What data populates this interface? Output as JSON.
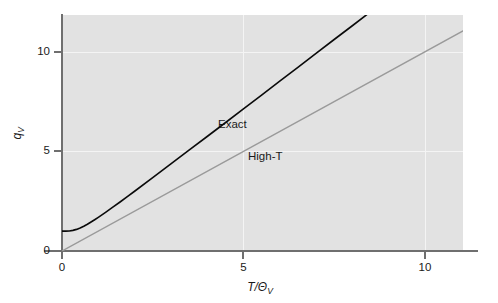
{
  "chart_data": {
    "type": "line",
    "title": "",
    "subtitle": "",
    "xlabel": "T/Θ_V",
    "ylabel": "q_V",
    "xlim": [
      0,
      11.05
    ],
    "ylim": [
      0,
      11.85
    ],
    "xticks": [
      0,
      5,
      10
    ],
    "yticks": [
      0,
      5,
      10
    ],
    "xticklabels": [
      "0",
      "5",
      "10"
    ],
    "yticklabels": [
      "0",
      "5",
      "10"
    ],
    "grid": true,
    "grid_color": "#f4f4f4",
    "panel_background": "#e2e2e2",
    "legend_position": "inline-annotations",
    "series": [
      {
        "name": "Exact",
        "color": "#0a0a0a",
        "linewidth": 1.6,
        "annotation": "Exact",
        "annotation_xy": [
          3.9,
          6.45
        ],
        "x": [
          0.0,
          0.1,
          0.2,
          0.3,
          0.4,
          0.5,
          0.6,
          0.7,
          0.8,
          0.9,
          1.0,
          1.2,
          1.4,
          1.6,
          1.8,
          2.0,
          2.5,
          3.0,
          3.5,
          4.0,
          4.5,
          5.0,
          5.5,
          6.0,
          6.5,
          7.0,
          7.5,
          8.0,
          8.5,
          9.0,
          9.5,
          10.0,
          10.5,
          11.0
        ],
        "y": [
          1.0,
          1.0,
          1.007,
          1.035,
          1.085,
          1.157,
          1.245,
          1.345,
          1.455,
          1.57,
          1.69,
          1.94,
          2.2,
          2.46,
          2.73,
          3.0,
          3.68,
          4.37,
          5.06,
          5.75,
          6.44,
          7.14,
          7.83,
          8.53,
          9.22,
          9.92,
          10.62,
          11.31,
          12.01,
          12.71,
          13.4,
          14.1,
          14.8,
          15.5
        ]
      },
      {
        "name": "High-T",
        "color": "#9a9a9a",
        "linewidth": 1.4,
        "annotation": "High-T",
        "annotation_xy": [
          4.7,
          5.15
        ],
        "x": [
          0.0,
          11.05
        ],
        "y": [
          0.0,
          11.05
        ]
      }
    ]
  },
  "axes": {
    "y_title_main": "q",
    "y_title_sub": "V",
    "x_title_main": "T/Θ",
    "x_title_sub": "V"
  },
  "labels": {
    "exact": "Exact",
    "high_t": "High-T"
  }
}
